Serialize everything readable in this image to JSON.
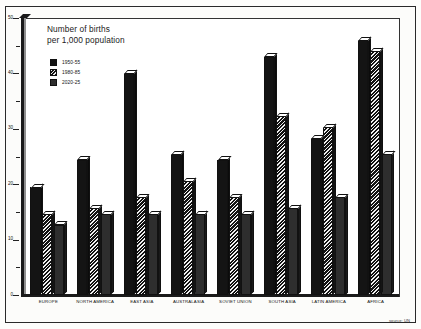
{
  "figure": {
    "title_line1": "Number of births",
    "title_line2": "per 1,000 population",
    "source_note": "source: UN"
  },
  "legend": {
    "items": [
      {
        "label": "1950-55",
        "swatch": "solid-black-swatch"
      },
      {
        "label": "1980-85",
        "swatch": "hatched-swatch"
      },
      {
        "label": "2020-25",
        "swatch": "dark-gray-swatch"
      }
    ]
  },
  "axis": {
    "y_ticks": [
      "0",
      "10",
      "20",
      "30",
      "40",
      "50"
    ],
    "y_minor_ticks": [
      5,
      15,
      25,
      35,
      45
    ]
  },
  "chart_data": {
    "type": "bar",
    "title": "Number of births per 1,000 population",
    "xlabel": "",
    "ylabel": "Number of births per 1,000 population",
    "ylim": [
      0,
      50
    ],
    "grid": false,
    "legend_position": "upper-left-inset",
    "annotations": [
      "source: UN"
    ],
    "categories": [
      "EUROPE",
      "NORTH AMERICA",
      "EAST ASIA",
      "AUSTRALASIA",
      "SOVIET UNION",
      "SOUTH ASIA",
      "LATIN AMERICA",
      "AFRICA"
    ],
    "series": [
      {
        "name": "1950-55",
        "values": [
          20,
          25,
          41,
          26,
          25,
          44,
          29,
          47
        ]
      },
      {
        "name": "1980-85",
        "values": [
          15,
          16,
          18,
          21,
          18,
          33,
          31,
          45
        ]
      },
      {
        "name": "2020-25",
        "values": [
          13,
          15,
          15,
          15,
          15,
          16,
          18,
          26
        ]
      }
    ]
  }
}
